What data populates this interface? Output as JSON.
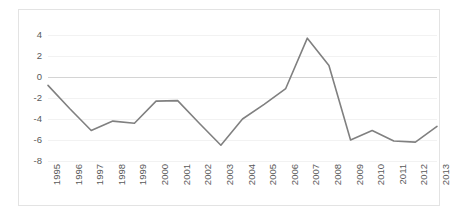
{
  "chart_data": {
    "type": "line",
    "title": "",
    "subtitle": "",
    "xlabel": "",
    "ylabel": "",
    "categories": [
      "1995",
      "1996",
      "1997",
      "1998",
      "1999",
      "2000",
      "2001",
      "2002",
      "2003",
      "2004",
      "2005",
      "2006",
      "2007",
      "2008",
      "2009",
      "2010",
      "2011",
      "2012",
      "2013"
    ],
    "series": [
      {
        "name": "series-1",
        "color": "#808080",
        "values": [
          -0.8,
          -3.0,
          -5.1,
          -4.2,
          -4.4,
          -2.3,
          -2.25,
          -4.4,
          -6.5,
          -4.0,
          -2.6,
          -1.1,
          3.7,
          1.1,
          -6.0,
          -5.1,
          -6.1,
          -6.2,
          -4.7
        ]
      }
    ],
    "ytick_labels": [
      "4",
      "2",
      "0",
      "-2",
      "-4",
      "-6",
      "-8"
    ],
    "ytick_values": [
      4,
      2,
      0,
      -2,
      -4,
      -6,
      -8
    ],
    "ylim": [
      -8,
      4
    ],
    "xlim": [
      "1995",
      "2013"
    ],
    "grid": true,
    "grid_axis": "y",
    "zero_line": true,
    "legend": false,
    "legend_position": "none",
    "annotations": []
  }
}
